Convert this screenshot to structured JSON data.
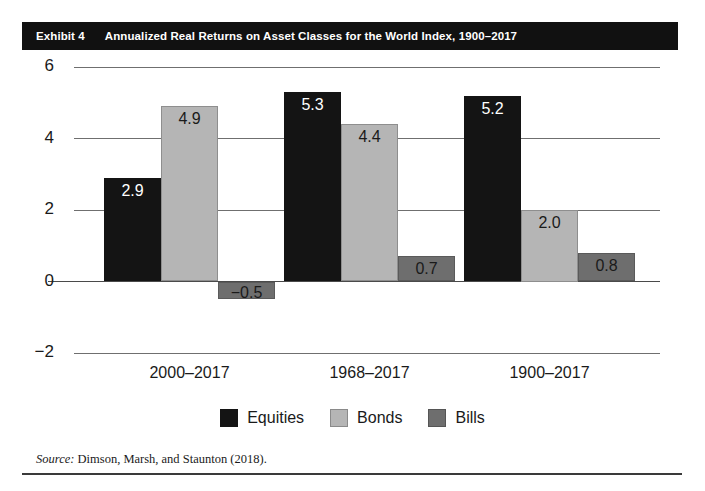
{
  "exhibit": {
    "label": "Exhibit 4",
    "title": "Annualized Real Returns on Asset Classes for the World Index, 1900–2017",
    "source": "Dimson, Marsh, and Staunton (2018).",
    "source_word": "Source:"
  },
  "chart_data": {
    "type": "bar",
    "title": "Annualized Real Returns on Asset Classes for the World Index, 1900–2017",
    "xlabel": "",
    "ylabel": "",
    "ylim": [
      -2,
      6
    ],
    "yticks": [
      "6",
      "4",
      "2",
      "0",
      "−2"
    ],
    "ytick_values": [
      6,
      4,
      2,
      0,
      -2
    ],
    "grid": true,
    "legend_position": "bottom",
    "categories": [
      "2000–2017",
      "1968–2017",
      "1900–2017"
    ],
    "series": [
      {
        "name": "Equities",
        "color": "#141414",
        "values": [
          2.9,
          5.3,
          5.2
        ],
        "labels": [
          "2.9",
          "5.3",
          "5.2"
        ]
      },
      {
        "name": "Bonds",
        "color": "#b5b5b5",
        "values": [
          4.9,
          4.4,
          2.0
        ],
        "labels": [
          "4.9",
          "4.4",
          "2.0"
        ]
      },
      {
        "name": "Bills",
        "color": "#6e6e6e",
        "values": [
          -0.5,
          0.7,
          0.8
        ],
        "labels": [
          "−0.5",
          "0.7",
          "0.8"
        ]
      }
    ]
  },
  "colors": {
    "title_bar": "#111111",
    "equities": "#141414",
    "bonds": "#b5b5b5",
    "bills": "#6e6e6e",
    "gridline": "#6f6f6f"
  }
}
